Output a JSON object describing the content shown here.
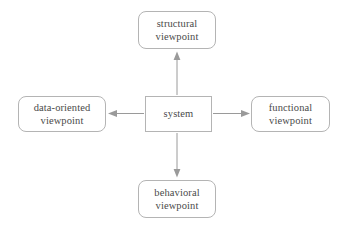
{
  "diagram": {
    "background_color": "#ffffff",
    "node_border_color": "#b4b4b4",
    "edge_color": "#9a9a9a",
    "text_color": "#4a4a4a",
    "nodes": [
      {
        "id": "structural",
        "shape": "rounded-rectangle",
        "line1": "structural",
        "line2": "viewpoint",
        "position": "top"
      },
      {
        "id": "data-oriented",
        "shape": "rounded-rectangle",
        "line1": "data-oriented",
        "line2": "viewpoint",
        "position": "left"
      },
      {
        "id": "system",
        "shape": "rectangle",
        "line1": "system",
        "line2": "",
        "position": "center"
      },
      {
        "id": "functional",
        "shape": "rounded-rectangle",
        "line1": "functional",
        "line2": "viewpoint",
        "position": "right"
      },
      {
        "id": "behavioral",
        "shape": "rounded-rectangle",
        "line1": "behavioral",
        "line2": "viewpoint",
        "position": "bottom"
      }
    ],
    "edges": [
      {
        "id": "system-to-structural",
        "from": "system",
        "to": "structural",
        "direction": "up",
        "arrow": "single"
      },
      {
        "id": "system-to-data",
        "from": "system",
        "to": "data-oriented",
        "direction": "left",
        "arrow": "single"
      },
      {
        "id": "system-to-functional",
        "from": "system",
        "to": "functional",
        "direction": "right",
        "arrow": "single"
      },
      {
        "id": "system-to-behavioral",
        "from": "system",
        "to": "behavioral",
        "direction": "down",
        "arrow": "single"
      }
    ]
  }
}
